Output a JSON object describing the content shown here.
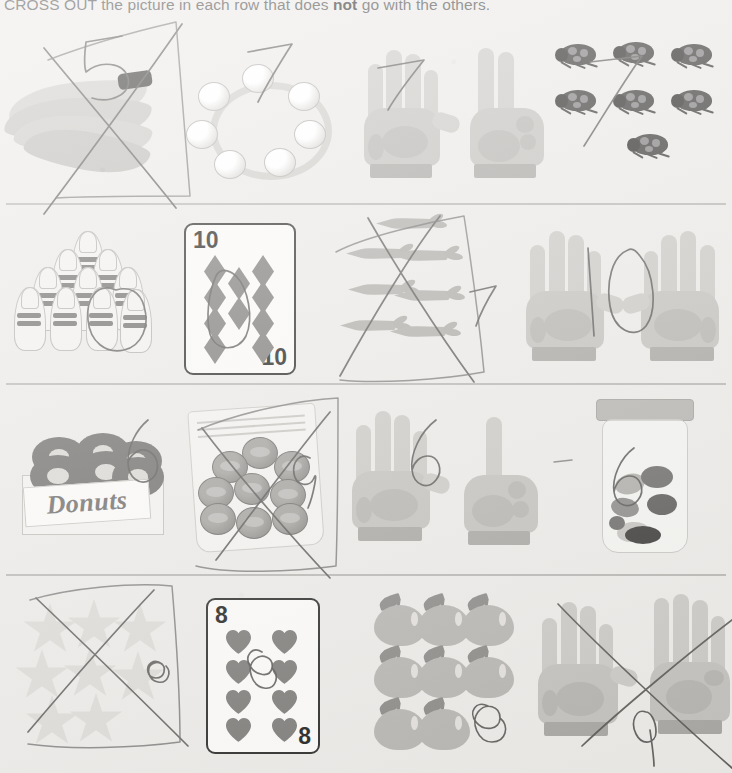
{
  "worksheet": {
    "instruction_prefix": "CROSS OUT the picture in each row that does ",
    "instruction_emphasis": "not",
    "instruction_suffix": " go with the others.",
    "background_color": "#eceae7",
    "ink_color": "#575654",
    "divider_color": "#b9b7b4"
  },
  "rows": [
    {
      "row_number": "1",
      "target_number": "7",
      "items": [
        {
          "name": "bananas",
          "label": "bananas",
          "count": "5",
          "written_answer": "5",
          "crossed_out": "true",
          "odd_one_out": "true"
        },
        {
          "name": "bead-necklace",
          "label": "bead necklace",
          "count": "7",
          "written_answer": "7",
          "crossed_out": "false",
          "odd_one_out": "false"
        },
        {
          "name": "hands-seven",
          "label": "hands showing seven",
          "count": "7",
          "written_answer": "7",
          "crossed_out": "false",
          "odd_one_out": "false"
        },
        {
          "name": "ladybugs",
          "label": "ladybugs",
          "count": "7",
          "written_answer": "7",
          "crossed_out": "false",
          "odd_one_out": "false"
        }
      ]
    },
    {
      "row_number": "2",
      "target_number": "10",
      "items": [
        {
          "name": "bowling-pins",
          "label": "bowling pins",
          "count": "10",
          "written_answer": "0",
          "crossed_out": "false",
          "odd_one_out": "false"
        },
        {
          "name": "playing-card-ten-diamonds",
          "label": "ten of diamonds card",
          "count": "10",
          "corner_value": "10",
          "written_answer": "0",
          "crossed_out": "false",
          "odd_one_out": "false"
        },
        {
          "name": "carrots",
          "label": "carrots",
          "count": "7",
          "written_answer": "7",
          "crossed_out": "true",
          "odd_one_out": "true"
        },
        {
          "name": "hands-ten",
          "label": "hands showing ten",
          "count": "10",
          "written_answer": "10",
          "crossed_out": "false",
          "odd_one_out": "false"
        }
      ]
    },
    {
      "row_number": "3",
      "target_number": "6",
      "items": [
        {
          "name": "donut-box",
          "label": "box of donuts",
          "count": "6",
          "box_label": "Donuts",
          "written_answer": "6",
          "crossed_out": "false",
          "odd_one_out": "false"
        },
        {
          "name": "coin-bag",
          "label": "bag of coins",
          "count": "9",
          "written_answer": "9",
          "crossed_out": "true",
          "odd_one_out": "true"
        },
        {
          "name": "hands-six",
          "label": "hands showing six",
          "count": "6",
          "written_answer": "6",
          "crossed_out": "false",
          "odd_one_out": "false"
        },
        {
          "name": "candy-jar",
          "label": "jar of candy",
          "count": "6",
          "written_answer": "6",
          "crossed_out": "false",
          "odd_one_out": "false"
        }
      ]
    },
    {
      "row_number": "4",
      "target_number": "8",
      "items": [
        {
          "name": "stars",
          "label": "stars",
          "count": "8",
          "written_answer": "8",
          "crossed_out": "true",
          "odd_one_out": "false"
        },
        {
          "name": "playing-card-eight-hearts",
          "label": "eight of hearts card",
          "count": "8",
          "corner_value": "8",
          "written_answer": "8",
          "crossed_out": "false",
          "odd_one_out": "false"
        },
        {
          "name": "apples",
          "label": "apples",
          "count": "8",
          "written_answer": "8",
          "crossed_out": "false",
          "odd_one_out": "false"
        },
        {
          "name": "hands-nine",
          "label": "hands showing nine",
          "count": "9",
          "written_answer": "9",
          "crossed_out": "true",
          "odd_one_out": "true"
        }
      ]
    }
  ]
}
